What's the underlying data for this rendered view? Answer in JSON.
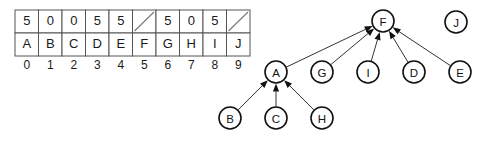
{
  "figure": {
    "hash_table": {
      "name": "hash-table",
      "value_row_label": "values",
      "key_row_label": "keys",
      "index_row_label": "indices",
      "empty_marker": "slash",
      "columns": [
        {
          "index": "0",
          "value": "5",
          "key": "A",
          "empty": false
        },
        {
          "index": "1",
          "value": "0",
          "key": "B",
          "empty": false
        },
        {
          "index": "2",
          "value": "0",
          "key": "C",
          "empty": false
        },
        {
          "index": "3",
          "value": "5",
          "key": "D",
          "empty": false
        },
        {
          "index": "4",
          "value": "5",
          "key": "E",
          "empty": false
        },
        {
          "index": "5",
          "value": "",
          "key": "F",
          "empty": true
        },
        {
          "index": "6",
          "value": "5",
          "key": "G",
          "empty": false
        },
        {
          "index": "7",
          "value": "0",
          "key": "H",
          "empty": false
        },
        {
          "index": "8",
          "value": "5",
          "key": "I",
          "empty": false
        },
        {
          "index": "9",
          "value": "",
          "key": "J",
          "empty": true
        }
      ]
    },
    "graph": {
      "name": "collision-graph",
      "nodes": [
        {
          "id": "F",
          "label": "F",
          "cx": 383,
          "cy": 21,
          "r": 11
        },
        {
          "id": "J",
          "label": "J",
          "cx": 456,
          "cy": 22,
          "r": 11
        },
        {
          "id": "A",
          "label": "A",
          "cx": 276,
          "cy": 72,
          "r": 11
        },
        {
          "id": "G",
          "label": "G",
          "cx": 322,
          "cy": 72,
          "r": 11
        },
        {
          "id": "I",
          "label": "I",
          "cx": 368,
          "cy": 72,
          "r": 11
        },
        {
          "id": "D",
          "label": "D",
          "cx": 414,
          "cy": 72,
          "r": 11
        },
        {
          "id": "E",
          "label": "E",
          "cx": 460,
          "cy": 72,
          "r": 11
        },
        {
          "id": "B",
          "label": "B",
          "cx": 230,
          "cy": 118,
          "r": 11
        },
        {
          "id": "C",
          "label": "C",
          "cx": 276,
          "cy": 118,
          "r": 11
        },
        {
          "id": "H",
          "label": "H",
          "cx": 322,
          "cy": 118,
          "r": 11
        }
      ],
      "edges": [
        {
          "from": "A",
          "to": "F",
          "directed": true
        },
        {
          "from": "G",
          "to": "F",
          "directed": true
        },
        {
          "from": "I",
          "to": "F",
          "directed": true
        },
        {
          "from": "D",
          "to": "F",
          "directed": true
        },
        {
          "from": "E",
          "to": "F",
          "directed": true
        },
        {
          "from": "B",
          "to": "A",
          "directed": true
        },
        {
          "from": "C",
          "to": "A",
          "directed": true
        },
        {
          "from": "H",
          "to": "A",
          "directed": true
        }
      ],
      "isolated_nodes": [
        "J"
      ]
    },
    "colors": {
      "background": "#ffffff",
      "table_border": "#555555",
      "table_text": "#1a1a1a",
      "slash": "#777777",
      "node_stroke": "#111111",
      "node_fill": "#ffffff",
      "edge_stroke": "#333333",
      "arrow_fill": "#111111"
    },
    "layout": {
      "table_origin_x": 15,
      "table_origin_y": 10,
      "cell_width": 23.5,
      "row_height": 23,
      "index_row_y": 66
    }
  }
}
